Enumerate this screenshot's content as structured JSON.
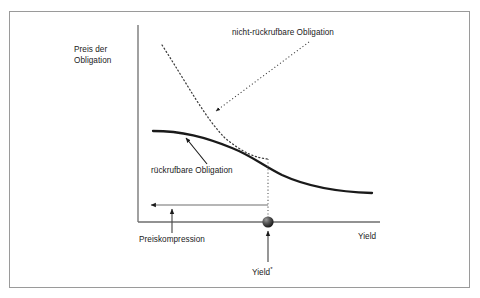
{
  "figure": {
    "type": "line-diagram",
    "language": "de",
    "axes": {
      "y_label": "Preis der\nObligation",
      "x_label": "Yield",
      "y_axis_x": 138,
      "y_axis_top": 25,
      "x_axis_y": 222,
      "x_axis_right": 380
    },
    "labels": {
      "y_axis": "Preis der\nObligation",
      "noncallable": "nicht-rückrufbare Obligation",
      "callable": "rückrufbare Obligation",
      "compression": "Preiskompression",
      "yield_star": "Yield",
      "yield_star_mark": "*",
      "x_axis": "Yield"
    },
    "colors": {
      "frame": "#9a9a9a",
      "axis": "#6e6e6e",
      "curve_callable": "#1a1a1a",
      "curve_noncallable": "#3c3c3c",
      "marker": "#2a2a2a",
      "text": "#1a1a1a"
    },
    "series": [
      {
        "name": "rückrufbare Obligation",
        "style": "solid",
        "description": "Preis der rückrufbaren Obligation: flach bei hohem Preis links, fällt nach rechts ab",
        "points": [
          [
            153,
            131
          ],
          [
            186,
            133
          ],
          [
            214,
            140
          ],
          [
            240,
            150
          ],
          [
            268,
            159
          ],
          [
            296,
            171
          ],
          [
            324,
            181
          ],
          [
            350,
            188
          ],
          [
            372,
            193
          ]
        ]
      },
      {
        "name": "nicht-rückrufbare Obligation",
        "style": "dotted",
        "description": "Preis der nicht-rückrufbaren Obligation: konvex fallend, schneidet die rückrufbare Kurve bei Yield*",
        "points": [
          [
            162,
            45
          ],
          [
            180,
            70
          ],
          [
            196,
            91
          ],
          [
            214,
            110
          ],
          [
            232,
            127
          ],
          [
            250,
            144
          ],
          [
            268,
            159
          ]
        ]
      }
    ],
    "annotations": [
      {
        "name": "noncallable-leader",
        "from": [
          309,
          42
        ],
        "to": [
          216,
          111
        ],
        "style": "dotted",
        "arrow": "end"
      },
      {
        "name": "callable-leader",
        "from": [
          205,
          163
        ],
        "to": [
          185,
          138
        ],
        "style": "solid",
        "arrow": "end"
      },
      {
        "name": "price-compression-arrow",
        "from": [
          268,
          205
        ],
        "to": [
          150,
          205
        ],
        "style": "solid",
        "arrow": "end"
      },
      {
        "name": "compression-callout",
        "from": [
          172,
          233
        ],
        "to": [
          172,
          208
        ],
        "style": "solid",
        "arrow": "end"
      },
      {
        "name": "yield-star-callout",
        "from": [
          268,
          262
        ],
        "to": [
          268,
          230
        ],
        "style": "solid",
        "arrow": "end"
      },
      {
        "name": "yield-star-dropline",
        "from": [
          268,
          159
        ],
        "to": [
          268,
          222
        ],
        "style": "dotted",
        "arrow": "none"
      }
    ],
    "marker": {
      "name": "yield-star-marker",
      "shape": "sphere",
      "x": 268,
      "y": 222,
      "r": 5.5
    }
  }
}
